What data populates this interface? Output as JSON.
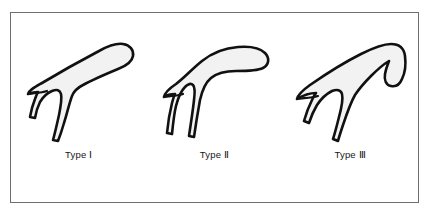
{
  "figure": {
    "background_color": "#ffffff",
    "frame_color": "#6e6e6e",
    "shape_outline_color": "#111111",
    "shape_fill_color": "#f2f2f2",
    "label_color": "#171717",
    "panels": [
      {
        "label": "Type Ⅰ",
        "shape_name": "flat-acromion-outline",
        "description": "flat"
      },
      {
        "label": "Type Ⅱ",
        "shape_name": "curved-acromion-outline",
        "description": "curved"
      },
      {
        "label": "Type Ⅲ",
        "shape_name": "hooked-acromion-outline",
        "description": "hooked"
      }
    ]
  }
}
